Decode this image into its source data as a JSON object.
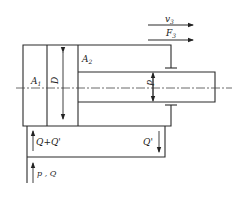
{
  "diagram": {
    "type": "hydraulic-cylinder-differential-connection",
    "labels": {
      "velocity": "v",
      "velocity_sub": "3",
      "force": "F",
      "force_sub": "3",
      "area_cap": "A",
      "area_cap_sub": "1",
      "area_rod": "A",
      "area_rod_sub": "2",
      "bore_diameter": "D",
      "rod_diameter": "d",
      "flow_combined": "Q+Q'",
      "flow_return": "Q'",
      "supply": "p , Q"
    }
  }
}
